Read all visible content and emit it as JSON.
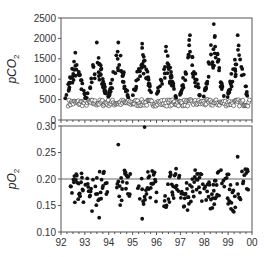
{
  "chart_data": [
    {
      "type": "scatter",
      "title": "",
      "ylabel": "pCO2",
      "ylabel_parts": {
        "main": "pCO",
        "sub": "2"
      },
      "xlabel": "",
      "xlim": [
        92,
        100
      ],
      "ylim": [
        0,
        2500
      ],
      "yticks": [
        0,
        500,
        1000,
        1500,
        2000,
        2500
      ],
      "ytick_labels": [
        "0",
        "500",
        "1000",
        "1500",
        "2000",
        "2500"
      ],
      "grid": false,
      "series": [
        {
          "name": "filled",
          "marker": "filled-circle",
          "description": "seasonal high pCO2 values, peaks 1500-2350 each year",
          "seasonal_peaks": [
            {
              "x": 92.6,
              "y": 1650
            },
            {
              "x": 93.5,
              "y": 1900
            },
            {
              "x": 94.4,
              "y": 1900
            },
            {
              "x": 95.4,
              "y": 1870
            },
            {
              "x": 96.4,
              "y": 1800
            },
            {
              "x": 97.4,
              "y": 2080
            },
            {
              "x": 98.4,
              "y": 2350
            },
            {
              "x": 99.4,
              "y": 2080
            }
          ]
        },
        {
          "name": "open",
          "marker": "open-circle",
          "description": "near-atmospheric baseline ~350-500",
          "approx_range": [
            300,
            500
          ]
        }
      ]
    },
    {
      "type": "scatter",
      "ylabel": "pO2",
      "ylabel_parts": {
        "main": "pO",
        "sub": "2"
      },
      "xlabel": "",
      "xlim": [
        92,
        100
      ],
      "ylim": [
        0.1,
        0.3
      ],
      "yticks": [
        0.1,
        0.15,
        0.2,
        0.25,
        0.3
      ],
      "ytick_labels": [
        "0.10",
        "0.15",
        "0.20",
        "0.25",
        "0.30"
      ],
      "xticks": [
        92,
        93,
        94,
        95,
        96,
        97,
        98,
        99,
        100
      ],
      "xtick_labels": [
        "92",
        "93",
        "94",
        "95",
        "96",
        "97",
        "98",
        "99",
        "00"
      ],
      "reference_line": 0.2,
      "grid": false,
      "series": [
        {
          "name": "filled",
          "marker": "filled-circle",
          "description": "pO2 mostly 0.14-0.21, outliers to 0.30 in 95.5",
          "notable_points": [
            {
              "x": 93.6,
              "y": 0.127
            },
            {
              "x": 94.4,
              "y": 0.265
            },
            {
              "x": 95.5,
              "y": 0.298
            },
            {
              "x": 95.4,
              "y": 0.125
            },
            {
              "x": 99.4,
              "y": 0.242
            }
          ]
        }
      ]
    }
  ]
}
